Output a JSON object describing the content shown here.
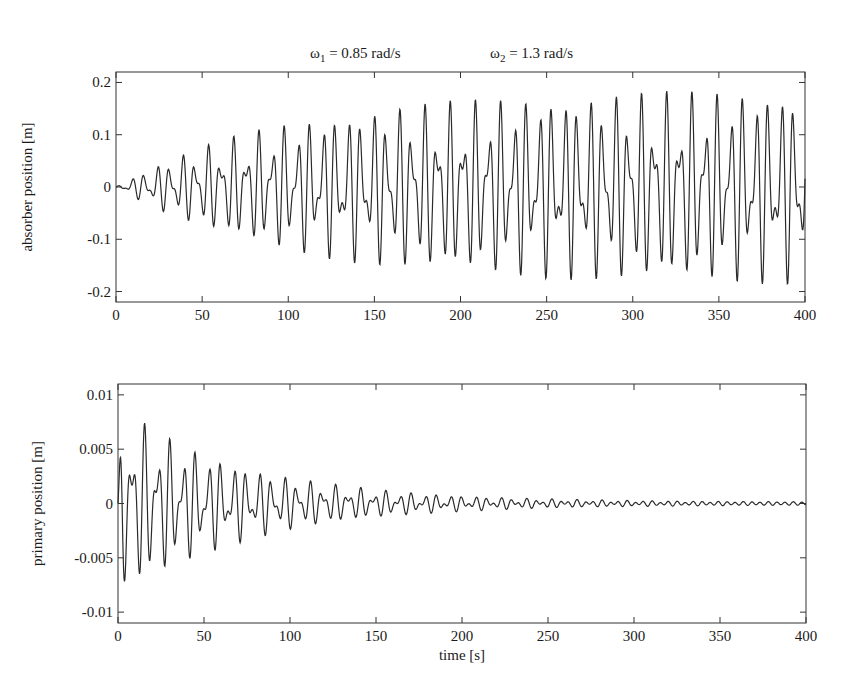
{
  "title": {
    "omega1": {
      "symbol": "ω",
      "sub": "1",
      "rest": " = 0.85 rad/s"
    },
    "omega2": {
      "symbol": "ω",
      "sub": "2",
      "rest": " = 1.3 rad/s"
    }
  },
  "colors": {
    "line": "#2a2a2a",
    "axes": "#333333",
    "background": "#ffffff"
  },
  "chart_data": [
    {
      "type": "line",
      "title": "ω1 = 0.85 rad/s    ω2 = 1.3 rad/s",
      "xlabel": "",
      "ylabel": "absorber position [m]",
      "xlim": [
        0,
        400
      ],
      "ylim": [
        -0.22,
        0.22
      ],
      "xticks": [
        0,
        50,
        100,
        150,
        200,
        250,
        300,
        350,
        400
      ],
      "xtick_labels": [
        "0",
        "50",
        "100",
        "150",
        "200",
        "250",
        "300",
        "350",
        "400"
      ],
      "yticks": [
        -0.2,
        -0.1,
        0,
        0.1,
        0.2
      ],
      "ytick_labels": [
        "-0.2",
        "-0.1",
        "0",
        "0.1",
        "0.2"
      ],
      "grid": false,
      "signal": {
        "description": "two-tone oscillation growing from 0 and saturating near ±0.2 m",
        "omega1": 0.85,
        "omega2": 1.3,
        "amp1": 0.115,
        "amp2": 0.075,
        "growth_tau": 95,
        "initial": 0.0
      },
      "envelope_samples": {
        "x": [
          0,
          25,
          50,
          75,
          100,
          150,
          200,
          250,
          300,
          350,
          400
        ],
        "max": [
          0.01,
          0.05,
          0.08,
          0.13,
          0.15,
          0.18,
          0.19,
          0.19,
          0.2,
          0.19,
          0.2
        ],
        "min": [
          -0.02,
          -0.06,
          -0.09,
          -0.12,
          -0.15,
          -0.17,
          -0.18,
          -0.18,
          -0.18,
          -0.18,
          -0.18
        ]
      }
    },
    {
      "type": "line",
      "title": "",
      "xlabel": "time [s]",
      "ylabel": "primary position [m]",
      "xlim": [
        0,
        400
      ],
      "ylim": [
        -0.011,
        0.011
      ],
      "xticks": [
        0,
        50,
        100,
        150,
        200,
        250,
        300,
        350,
        400
      ],
      "xtick_labels": [
        "0",
        "50",
        "100",
        "150",
        "200",
        "250",
        "300",
        "350",
        "400"
      ],
      "yticks": [
        -0.01,
        -0.005,
        0,
        0.005,
        0.01
      ],
      "ytick_labels": [
        "-0.01",
        "-0.005",
        "0",
        "0.005",
        "0.01"
      ],
      "grid": false,
      "signal": {
        "description": "decaying two-tone oscillation, peak ~0.01 m at start, near 0 after ~250 s",
        "omega1": 0.85,
        "omega2": 1.3,
        "amp1": 0.0055,
        "amp2": 0.0035,
        "decay_tau": 75,
        "floor_amp": 0.00012
      },
      "envelope_samples": {
        "x": [
          0,
          10,
          25,
          50,
          75,
          100,
          150,
          200,
          250,
          300,
          400
        ],
        "max": [
          0.01,
          0.007,
          0.0065,
          0.005,
          0.004,
          0.003,
          0.0015,
          0.0008,
          0.0004,
          0.0003,
          0.0002
        ],
        "min": [
          -0.003,
          -0.0083,
          -0.006,
          -0.005,
          -0.004,
          -0.003,
          -0.0015,
          -0.0008,
          -0.0004,
          -0.0003,
          -0.0002
        ]
      }
    }
  ]
}
